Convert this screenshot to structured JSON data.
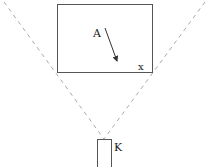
{
  "diagram": {
    "labels": {
      "A": "A",
      "x": "x",
      "K": "K"
    },
    "colors": {
      "line": "#333333",
      "dashed": "#aaaaaa",
      "background": "#ffffff"
    },
    "elements": {
      "screen_rect": {
        "x": 57,
        "y": 4,
        "width": 96,
        "height": 69
      },
      "device_rect": {
        "x": 97,
        "y": 139,
        "width": 15,
        "height": 30
      },
      "apex": {
        "x": 104,
        "y": 139
      },
      "arrow": {
        "x1": 105,
        "y1": 28,
        "x2": 117,
        "y2": 62
      }
    }
  }
}
